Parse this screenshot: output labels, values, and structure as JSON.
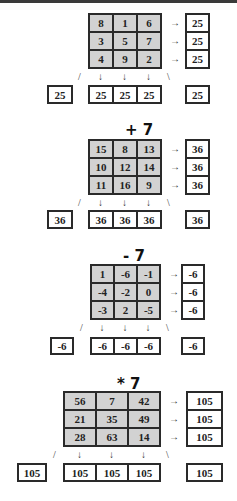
{
  "sections": [
    {
      "operator": "",
      "grid": [
        [
          "8",
          "1",
          "6"
        ],
        [
          "3",
          "5",
          "7"
        ],
        [
          "4",
          "9",
          "2"
        ]
      ],
      "row_sums": [
        "25",
        "25",
        "25"
      ],
      "col_sums": [
        "25",
        "25",
        "25"
      ],
      "diag_left": "25",
      "diag_right": "25"
    },
    {
      "operator": "+ 7",
      "grid": [
        [
          "15",
          "8",
          "13"
        ],
        [
          "10",
          "12",
          "14"
        ],
        [
          "11",
          "16",
          "9"
        ]
      ],
      "row_sums": [
        "36",
        "36",
        "36"
      ],
      "col_sums": [
        "36",
        "36",
        "36"
      ],
      "diag_left": "36",
      "diag_right": "36"
    },
    {
      "operator": "- 7",
      "grid": [
        [
          "1",
          "-6",
          "-1"
        ],
        [
          "-4",
          "-2",
          "0"
        ],
        [
          "-3",
          "2",
          "-5"
        ]
      ],
      "row_sums": [
        "-6",
        "-6",
        "-6"
      ],
      "col_sums": [
        "-6",
        "-6",
        "-6"
      ],
      "diag_left": "-6",
      "diag_right": "-6"
    },
    {
      "operator": "* 7",
      "grid": [
        [
          "56",
          "7",
          "42"
        ],
        [
          "21",
          "35",
          "49"
        ],
        [
          "28",
          "63",
          "14"
        ]
      ],
      "row_sums": [
        "105",
        "105",
        "105"
      ],
      "col_sums": [
        "105",
        "105",
        "105"
      ],
      "diag_left": "105",
      "diag_right": "105"
    }
  ],
  "glyphs": {
    "arrow_right": "→",
    "arrow_down": "↓",
    "diag_left": "/",
    "diag_right": "\\"
  }
}
